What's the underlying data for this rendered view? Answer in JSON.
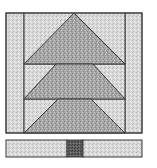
{
  "diagram": {
    "type": "quilt-block",
    "colors": {
      "background": "#ffffff",
      "light_fabric": "#d6d6d6",
      "medium_fabric": "#a8a8a8",
      "dark_fabric": "#5a5a5a",
      "outline": "#3a3a3a"
    },
    "pieces": {
      "side_strips": 2,
      "background_panels": 6,
      "tree_triangles": 3,
      "trunk_strip_sections": 3
    },
    "block": {
      "x": 6,
      "y": 13,
      "width": 136,
      "height": 120
    },
    "side_strip_width": 18,
    "tiers": [
      {
        "top": 13,
        "bottom": 64,
        "left": 24,
        "right": 125
      },
      {
        "top": 64,
        "bottom": 99,
        "left": 24,
        "right": 125
      },
      {
        "top": 99,
        "bottom": 133,
        "left": 24,
        "right": 125
      }
    ],
    "trunk_bar": {
      "x": 6,
      "y": 140,
      "width": 136,
      "height": 17
    },
    "trunk": {
      "x": 67,
      "width": 16
    }
  }
}
